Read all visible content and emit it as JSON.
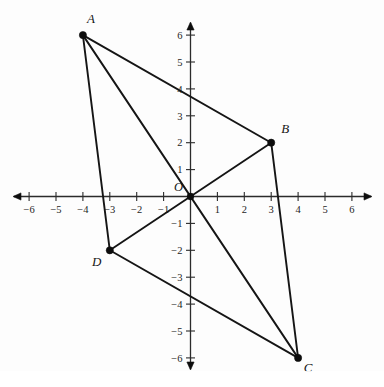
{
  "figure": {
    "origin_label": "O",
    "axis_color": "#2b2b2b",
    "segment_color": "#151515",
    "point_color": "#0d0d0d",
    "background": "#fdfdfd"
  },
  "chart_data": {
    "type": "scatter",
    "title": "",
    "xlabel": "",
    "ylabel": "",
    "xlim": [
      -6.5,
      6.9
    ],
    "ylim": [
      -6.5,
      6.5
    ],
    "grid": false,
    "legend": "none",
    "x_ticks": [
      -6,
      -5,
      -4,
      -3,
      -2,
      -1,
      1,
      2,
      3,
      4,
      5,
      6
    ],
    "y_ticks": [
      6,
      5,
      4,
      3,
      2,
      1,
      -1,
      -2,
      -3,
      -4,
      -5,
      -6
    ],
    "x_tick_labels": [
      "−6",
      "−5",
      "−4",
      "−3",
      "−2",
      "−1",
      "1",
      "2",
      "3",
      "4",
      "5",
      "6"
    ],
    "y_tick_labels": [
      "6",
      "5",
      "4",
      "3",
      "2",
      "1",
      "−1",
      "−2",
      "−3",
      "−4",
      "−5",
      "−6"
    ],
    "points": [
      {
        "label": "A",
        "x": -4,
        "y": 6,
        "label_dx": 8,
        "label_dy": -12
      },
      {
        "label": "B",
        "x": 3,
        "y": 2,
        "label_dx": 14,
        "label_dy": -10
      },
      {
        "label": "C",
        "x": 4,
        "y": -6,
        "label_dx": 10,
        "label_dy": 14
      },
      {
        "label": "D",
        "x": -3,
        "y": -2,
        "label_dx": -13,
        "label_dy": 16
      }
    ],
    "segments": [
      {
        "name": "side-AB",
        "from": "A",
        "to": "B"
      },
      {
        "name": "side-BC",
        "from": "B",
        "to": "C"
      },
      {
        "name": "side-CD",
        "from": "C",
        "to": "D"
      },
      {
        "name": "side-DA",
        "from": "D",
        "to": "A"
      },
      {
        "name": "diagonal-AC",
        "from": "A",
        "to": "C"
      },
      {
        "name": "diagonal-BD",
        "from": "B",
        "to": "D"
      }
    ]
  }
}
